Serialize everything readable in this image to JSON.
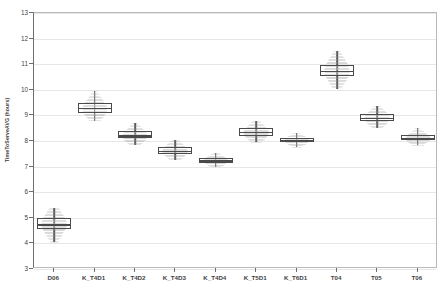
{
  "chart_data": {
    "type": "box",
    "title": "",
    "xlabel": "",
    "ylabel": "TimeToServeAVG (hours)",
    "ylim": [
      3,
      13
    ],
    "yticks": [
      3,
      4,
      5,
      6,
      7,
      8,
      9,
      10,
      11,
      12,
      13
    ],
    "grid": true,
    "legend": "none",
    "categories": [
      "D06",
      "K_T4D1",
      "K_T4D2",
      "K_T4D3",
      "K_T4D4",
      "K_T5D1",
      "K_T6D1",
      "T04",
      "T05",
      "T06"
    ],
    "boxes": [
      {
        "category": "D06",
        "whisker_low": 4.05,
        "q1": 4.55,
        "median": 4.75,
        "q3": 5.0,
        "whisker_high": 5.4,
        "density_peak": 4.78
      },
      {
        "category": "K_T4D1",
        "whisker_low": 8.8,
        "q1": 9.1,
        "median": 9.3,
        "q3": 9.5,
        "whisker_high": 9.95,
        "density_peak": 9.28
      },
      {
        "category": "K_T4D2",
        "whisker_low": 7.85,
        "q1": 8.1,
        "median": 8.22,
        "q3": 8.4,
        "whisker_high": 8.7,
        "density_peak": 8.22
      },
      {
        "category": "K_T4D3",
        "whisker_low": 7.25,
        "q1": 7.5,
        "median": 7.62,
        "q3": 7.78,
        "whisker_high": 8.05,
        "density_peak": 7.62
      },
      {
        "category": "K_T4D4",
        "whisker_low": 7.0,
        "q1": 7.15,
        "median": 7.25,
        "q3": 7.35,
        "whisker_high": 7.55,
        "density_peak": 7.25
      },
      {
        "category": "K_T5D1",
        "whisker_low": 7.95,
        "q1": 8.2,
        "median": 8.35,
        "q3": 8.5,
        "whisker_high": 8.8,
        "density_peak": 8.35
      },
      {
        "category": "K_T6D1",
        "whisker_low": 7.75,
        "q1": 7.95,
        "median": 8.03,
        "q3": 8.12,
        "whisker_high": 8.3,
        "density_peak": 8.03
      },
      {
        "category": "T04",
        "whisker_low": 10.05,
        "q1": 10.55,
        "median": 10.75,
        "q3": 10.95,
        "whisker_high": 11.5,
        "density_peak": 10.75
      },
      {
        "category": "T05",
        "whisker_low": 8.5,
        "q1": 8.78,
        "median": 8.9,
        "q3": 9.05,
        "whisker_high": 9.35,
        "density_peak": 8.9
      },
      {
        "category": "T06",
        "whisker_low": 7.85,
        "q1": 8.02,
        "median": 8.12,
        "q3": 8.25,
        "whisker_high": 8.5,
        "density_peak": 8.12
      }
    ],
    "colors": {
      "box_edge": "#4a4a4a",
      "whisker": "#555555",
      "density": "#9a9a9a",
      "gridline": "#e6e6e6",
      "axis": "#6d6d6d",
      "background": "#ffffff"
    }
  }
}
